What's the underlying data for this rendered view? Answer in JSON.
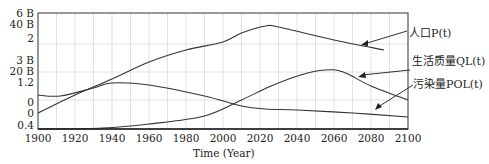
{
  "chart_data": {
    "type": "line",
    "title": "",
    "xlabel": "Time (Year)",
    "ylabel": "",
    "xlim": [
      1900,
      2100
    ],
    "x_ticks": [
      "1900",
      "1920",
      "1940",
      "1960",
      "1980",
      "2000",
      "2020",
      "2040",
      "2060",
      "2080",
      "2100"
    ],
    "y_tick_labels": [
      "6 B",
      "40 B",
      "2",
      "3 B",
      "20 B",
      "1.2",
      "0",
      "0",
      "0.4"
    ],
    "grid": true,
    "legend_position": "right (annotated with arrows)",
    "series": [
      {
        "name": "人口P(t)",
        "label_prefix": "人口",
        "label_var": "P(t)",
        "x": [
          1900,
          1920,
          1940,
          1960,
          1980,
          2000,
          2010,
          2023,
          2030,
          2060,
          2087
        ],
        "y_px": [
          113,
          95,
          79,
          62,
          50,
          42,
          33,
          26,
          27,
          40,
          50
        ]
      },
      {
        "name": "生活质量QL(t)",
        "label_prefix": "生活质量",
        "label_var": "QL(t)",
        "x": [
          1900,
          1912,
          1930,
          1940,
          1960,
          1990,
          2010,
          2023,
          2040,
          2070,
          2100
        ],
        "y_px": [
          95,
          96,
          88,
          83,
          85,
          96,
          106,
          109,
          110,
          113,
          117
        ]
      },
      {
        "name": "污染量POL(t)",
        "label_prefix": "污染量",
        "label_var": "POL(t)",
        "x": [
          1900,
          1935,
          1960,
          1990,
          2010,
          2026,
          2042,
          2055,
          2065,
          2080,
          2100
        ],
        "y_px": [
          129,
          128,
          124,
          116,
          100,
          86,
          75,
          70,
          72,
          86,
          100
        ]
      }
    ]
  },
  "axis": {
    "xlabel": "Time (Year)",
    "xticks": [
      {
        "label": "1900",
        "x": 38
      },
      {
        "label": "1920",
        "x": 75
      },
      {
        "label": "1940",
        "x": 112
      },
      {
        "label": "1960",
        "x": 149
      },
      {
        "label": "1980",
        "x": 186
      },
      {
        "label": "2000",
        "x": 223
      },
      {
        "label": "2020",
        "x": 260
      },
      {
        "label": "2040",
        "x": 297
      },
      {
        "label": "2060",
        "x": 334
      },
      {
        "label": "2080",
        "x": 371
      },
      {
        "label": "2100",
        "x": 408
      }
    ],
    "yticks": [
      {
        "label": "6 B",
        "y": 8
      },
      {
        "label": "40 B",
        "y": 19
      },
      {
        "label": "2",
        "y": 33
      },
      {
        "label": "3 B",
        "y": 55
      },
      {
        "label": "20 B",
        "y": 66
      },
      {
        "label": "1.2",
        "y": 77
      },
      {
        "label": "0",
        "y": 97
      },
      {
        "label": "0",
        "y": 108
      },
      {
        "label": "0.4",
        "y": 120
      }
    ]
  },
  "legend": {
    "population": {
      "prefix": "人口",
      "var": "P(t)"
    },
    "quality": {
      "prefix": "生活质量",
      "var": "QL(t)"
    },
    "pollution": {
      "prefix": "污染量",
      "var": "POL(t)"
    }
  },
  "colors": {
    "line": "#333333",
    "grid": "#d9d9d9",
    "frame": "#555555"
  }
}
